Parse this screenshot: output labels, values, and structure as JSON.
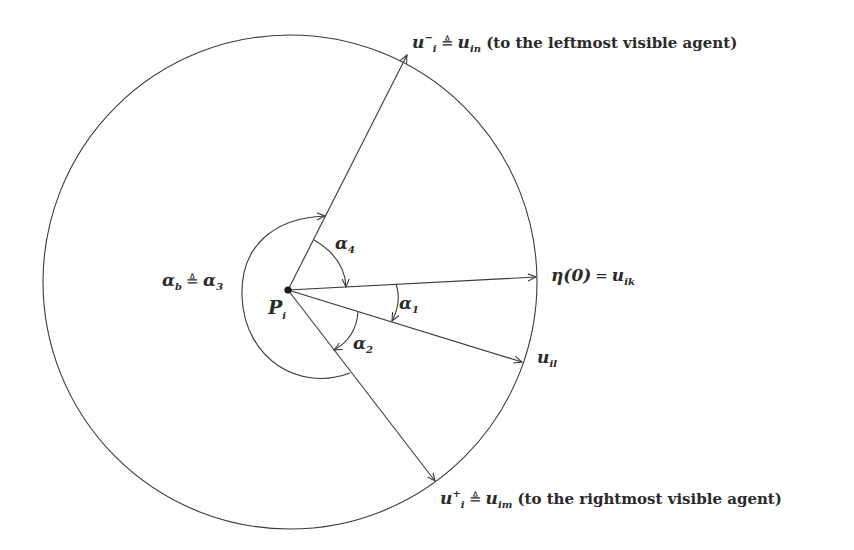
{
  "diagram": {
    "center_point": {
      "label": "P",
      "sub": "i",
      "x": 288,
      "y": 290
    },
    "circle": {
      "cx": 290,
      "cy": 282,
      "r": 247
    },
    "vectors": [
      {
        "id": "u_in",
        "tip": [
          407,
          55
        ]
      },
      {
        "id": "eta0",
        "tip": [
          536,
          277
        ]
      },
      {
        "id": "u_il",
        "tip": [
          522,
          362
        ]
      },
      {
        "id": "u_im",
        "tip": [
          435,
          481
        ]
      }
    ],
    "labels": {
      "u_in": {
        "base": "u",
        "sub": "i",
        "sup": "−",
        "defsym": "≜",
        "rhs_base": "u",
        "rhs_sub": "in",
        "note": "(to the leftmost visible agent)"
      },
      "eta0": {
        "lhs": "η(0)",
        "eq": "=",
        "rhs_base": "u",
        "rhs_sub": "ik"
      },
      "u_il": {
        "base": "u",
        "sub": "il"
      },
      "u_im": {
        "base": "u",
        "sub": "i",
        "sup": "+",
        "defsym": "≜",
        "rhs_base": "u",
        "rhs_sub": "im",
        "note": "(to the rightmost visible agent)"
      },
      "alpha1": {
        "base": "α",
        "sub": "1"
      },
      "alpha2": {
        "base": "α",
        "sub": "2"
      },
      "alpha4": {
        "base": "α",
        "sub": "4"
      },
      "alpha_b": {
        "base": "α",
        "sub": "b",
        "defsym": "≜",
        "rhs_base": "α",
        "rhs_sub": "3"
      }
    },
    "colors": {
      "stroke": "#3a3a3a",
      "text": "#2a2a2a",
      "background": "#ffffff"
    }
  }
}
